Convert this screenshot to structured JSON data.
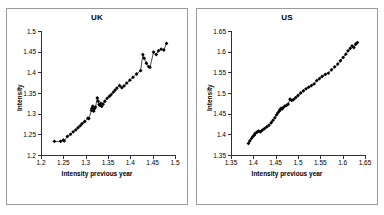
{
  "figure": {
    "background": "#ffffff",
    "panel_border_color": "#9a9a9a",
    "axis_color": "#2b2b55",
    "series_color": "#000000"
  },
  "panels": [
    {
      "id": "uk",
      "title": "UK",
      "xlabel": "Intensity previous year",
      "ylabel": "Intensity"
    },
    {
      "id": "us",
      "title": "US",
      "xlabel": "Intensity previous year",
      "ylabel": "Intensity"
    }
  ],
  "chart_data": [
    {
      "type": "scatter",
      "title": "UK",
      "xlabel": "Intensity previous year",
      "ylabel": "Intensity",
      "xlim": [
        1.2,
        1.5
      ],
      "ylim": [
        1.2,
        1.5
      ],
      "xticks": [
        "1.2",
        "1.25",
        "1.3",
        "1.35",
        "1.4",
        "1.45",
        "1.5"
      ],
      "yticks": [
        "1.2",
        "1.25",
        "1.3",
        "1.35",
        "1.4",
        "1.45",
        "1.5"
      ],
      "xtick_values": [
        1.2,
        1.25,
        1.3,
        1.35,
        1.4,
        1.45,
        1.5
      ],
      "ytick_values": [
        1.2,
        1.25,
        1.3,
        1.35,
        1.4,
        1.45,
        1.5
      ],
      "grid": false,
      "legend": false,
      "markers": "filled-diamond",
      "connected": true,
      "series": [
        {
          "name": "UK intensity vs previous year",
          "x": [
            1.23,
            1.244,
            1.25,
            1.252,
            1.259,
            1.266,
            1.272,
            1.278,
            1.283,
            1.288,
            1.292,
            1.298,
            1.305,
            1.307,
            1.313,
            1.314,
            1.316,
            1.318,
            1.32,
            1.322,
            1.326,
            1.328,
            1.33,
            1.332,
            1.334,
            1.336,
            1.339,
            1.343,
            1.348,
            1.353,
            1.357,
            1.362,
            1.366,
            1.37,
            1.376,
            1.381,
            1.386,
            1.392,
            1.399,
            1.406,
            1.414,
            1.423,
            1.428,
            1.431,
            1.436,
            1.441,
            1.444,
            1.452,
            1.458,
            1.463,
            1.469,
            1.475,
            1.481
          ],
          "y": [
            1.233,
            1.233,
            1.236,
            1.234,
            1.245,
            1.25,
            1.256,
            1.261,
            1.266,
            1.271,
            1.276,
            1.281,
            1.289,
            1.288,
            1.308,
            1.313,
            1.318,
            1.306,
            1.312,
            1.316,
            1.338,
            1.33,
            1.322,
            1.32,
            1.325,
            1.318,
            1.323,
            1.33,
            1.337,
            1.342,
            1.346,
            1.352,
            1.357,
            1.362,
            1.368,
            1.363,
            1.367,
            1.374,
            1.381,
            1.388,
            1.396,
            1.404,
            1.443,
            1.434,
            1.422,
            1.414,
            1.412,
            1.449,
            1.443,
            1.452,
            1.456,
            1.454,
            1.47
          ]
        }
      ]
    },
    {
      "type": "scatter",
      "title": "US",
      "xlabel": "Intensity previous year",
      "ylabel": "Intensity",
      "xlim": [
        1.35,
        1.65
      ],
      "ylim": [
        1.35,
        1.65
      ],
      "xticks": [
        "1.35",
        "1.4",
        "1.45",
        "1.5",
        "1.55",
        "1.6",
        "1.65"
      ],
      "yticks": [
        "1.35",
        "1.4",
        "1.45",
        "1.5",
        "1.55",
        "1.6",
        "1.65"
      ],
      "xtick_values": [
        1.35,
        1.4,
        1.45,
        1.5,
        1.55,
        1.6,
        1.65
      ],
      "ytick_values": [
        1.35,
        1.4,
        1.45,
        1.5,
        1.55,
        1.6,
        1.65
      ],
      "grid": false,
      "legend": false,
      "markers": "filled-diamond",
      "connected": true,
      "series": [
        {
          "name": "US intensity vs previous year",
          "x": [
            1.389,
            1.392,
            1.396,
            1.399,
            1.402,
            1.404,
            1.408,
            1.412,
            1.416,
            1.42,
            1.425,
            1.43,
            1.435,
            1.44,
            1.444,
            1.448,
            1.452,
            1.455,
            1.458,
            1.46,
            1.462,
            1.464,
            1.466,
            1.47,
            1.474,
            1.478,
            1.482,
            1.486,
            1.49,
            1.495,
            1.5,
            1.506,
            1.512,
            1.518,
            1.524,
            1.53,
            1.536,
            1.542,
            1.548,
            1.554,
            1.561,
            1.568,
            1.575,
            1.582,
            1.589,
            1.595,
            1.601,
            1.607,
            1.612,
            1.617,
            1.621,
            1.625,
            1.629,
            1.633
          ],
          "y": [
            1.378,
            1.384,
            1.39,
            1.395,
            1.398,
            1.402,
            1.405,
            1.408,
            1.406,
            1.41,
            1.414,
            1.418,
            1.422,
            1.428,
            1.434,
            1.44,
            1.447,
            1.452,
            1.456,
            1.46,
            1.463,
            1.461,
            1.464,
            1.468,
            1.47,
            1.473,
            1.485,
            1.482,
            1.484,
            1.489,
            1.494,
            1.5,
            1.505,
            1.51,
            1.514,
            1.518,
            1.522,
            1.53,
            1.535,
            1.54,
            1.545,
            1.548,
            1.556,
            1.563,
            1.57,
            1.578,
            1.586,
            1.594,
            1.602,
            1.608,
            1.614,
            1.61,
            1.618,
            1.622
          ]
        }
      ]
    }
  ]
}
